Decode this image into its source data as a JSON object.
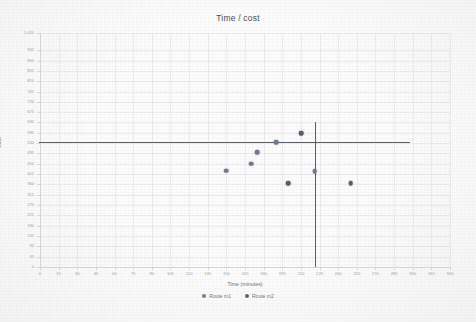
{
  "chart": {
    "title": "Time / cost",
    "xlabel": "Time (minutes)",
    "ylabel": "Cost"
  },
  "legend": {
    "items": [
      {
        "label": "Route m1",
        "color": "#6e7b8c"
      },
      {
        "label": "Route m2",
        "color": "#555e6b"
      }
    ]
  },
  "chart_data": {
    "type": "scatter",
    "title": "Time / cost",
    "xlabel": "Time (minutes)",
    "ylabel": "Cost",
    "xlim": [
      0,
      330
    ],
    "ylim": [
      0,
      1020
    ],
    "xticks": [
      0,
      15,
      30,
      45,
      60,
      75,
      90,
      105,
      120,
      135,
      150,
      165,
      180,
      195,
      210,
      225,
      240,
      255,
      270,
      285,
      300,
      315,
      330
    ],
    "yticks": [
      0,
      45,
      90,
      135,
      180,
      225,
      270,
      315,
      360,
      405,
      450,
      495,
      540,
      585,
      630,
      675,
      720,
      765,
      810,
      855,
      900,
      945,
      1020
    ],
    "ytick_labels": [
      "0",
      "45",
      "90",
      "135",
      "180",
      "225",
      "270",
      "315",
      "360",
      "405",
      "450",
      "495",
      "540",
      "585",
      "630",
      "675",
      "720",
      "765",
      "810",
      "855",
      "900",
      "945",
      "1,020"
    ],
    "grid": true,
    "legend_position": "bottom",
    "series": [
      {
        "name": "Route m1",
        "color": "#6e7b8c",
        "points": [
          {
            "x": 150,
            "y": 420
          },
          {
            "x": 170,
            "y": 450
          },
          {
            "x": 175,
            "y": 500
          },
          {
            "x": 190,
            "y": 545
          },
          {
            "x": 221,
            "y": 418
          }
        ]
      },
      {
        "name": "Route m2",
        "color": "#555e6b",
        "points": [
          {
            "x": 200,
            "y": 365
          },
          {
            "x": 210,
            "y": 583
          },
          {
            "x": 250,
            "y": 365
          }
        ]
      }
    ],
    "reference_lines": [
      {
        "orientation": "horizontal",
        "value": 545,
        "color": "#5d5d66"
      },
      {
        "orientation": "vertical",
        "value": 221,
        "color": "#5d5d66"
      }
    ]
  }
}
